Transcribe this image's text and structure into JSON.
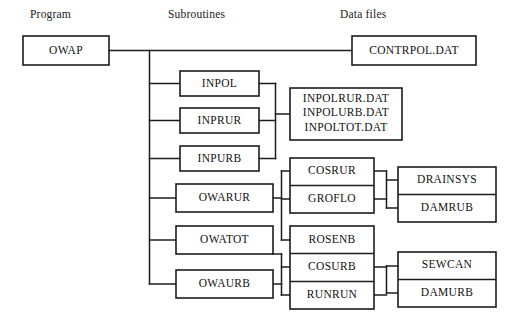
{
  "columns": [
    {
      "id": "program",
      "label": "Program",
      "x": 30,
      "y": 14
    },
    {
      "id": "subroutines",
      "label": "Subroutines",
      "x": 168,
      "y": 14
    },
    {
      "id": "data_files",
      "label": "Data files",
      "x": 340,
      "y": 14
    }
  ],
  "boxes": {
    "owap": {
      "label": "OWAP",
      "x": 23,
      "y": 36,
      "w": 86,
      "h": 29
    },
    "contrpol": {
      "label": "CONTRPOL.DAT",
      "x": 352,
      "y": 36,
      "w": 124,
      "h": 29
    },
    "inpol": {
      "label": "INPOL",
      "x": 180,
      "y": 71,
      "w": 79,
      "h": 25
    },
    "inprur": {
      "label": "INPRUR",
      "x": 180,
      "y": 108,
      "w": 79,
      "h": 25
    },
    "inpurb": {
      "label": "INPURB",
      "x": 180,
      "y": 146,
      "w": 79,
      "h": 25
    },
    "owarur": {
      "label": "OWARUR",
      "x": 176,
      "y": 184,
      "w": 97,
      "h": 28
    },
    "owatot": {
      "label": "OWATOT",
      "x": 176,
      "y": 226,
      "w": 97,
      "h": 28
    },
    "owaurb": {
      "label": "OWAURB",
      "x": 176,
      "y": 270,
      "w": 97,
      "h": 28
    },
    "inpol_files": {
      "lines": [
        "INPOLRUR.DAT",
        "INPOLURB.DAT",
        "INPOLTOT.DAT"
      ],
      "x": 290,
      "y": 88,
      "w": 112,
      "h": 52
    },
    "cos_group": {
      "x": 290,
      "y": 158,
      "w": 84,
      "h": 55,
      "rows": [
        {
          "label": "COSRUR"
        },
        {
          "label": "GROFLO"
        }
      ]
    },
    "ros_group": {
      "x": 290,
      "y": 226,
      "w": 84,
      "h": 83,
      "rows": [
        {
          "label": "ROSENB"
        },
        {
          "label": "COSURB"
        },
        {
          "label": "RUNRUN"
        }
      ]
    },
    "drain_group": {
      "x": 398,
      "y": 167,
      "w": 98,
      "h": 55,
      "rows": [
        {
          "label": "DRAINSYS"
        },
        {
          "label": "DAMRUB"
        }
      ]
    },
    "sew_group": {
      "x": 398,
      "y": 252,
      "w": 98,
      "h": 55,
      "rows": [
        {
          "label": "SEWCAN"
        },
        {
          "label": "DAMURB"
        }
      ]
    }
  },
  "colors": {
    "line": "#1c1c1c",
    "text": "#111111",
    "background": "#ffffff"
  }
}
